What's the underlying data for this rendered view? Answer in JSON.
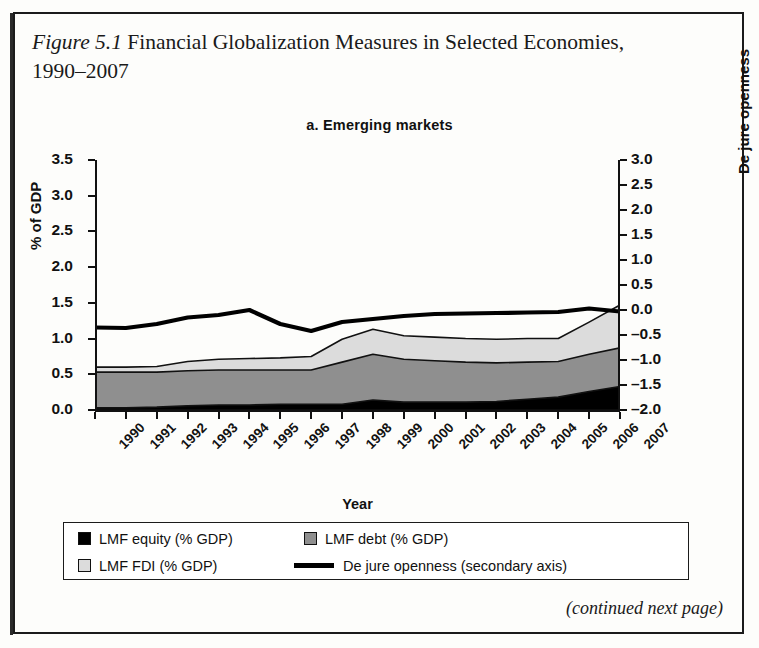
{
  "caption": {
    "figure_number": "Figure 5.1",
    "text": " Financial Globalization Measures in Selected Economies, 1990–2007"
  },
  "panel": {
    "title": "a. Emerging markets"
  },
  "footer": {
    "continued": "(continued next page)"
  },
  "legend": {
    "items": [
      {
        "label": "LMF equity  (% GDP)",
        "marker": "square",
        "color": "#000000"
      },
      {
        "label": "LMF debt  (% GDP)",
        "marker": "square",
        "color": "#8f8f8f"
      },
      {
        "label": "LMF FDI (% GDP)",
        "marker": "square",
        "color": "#dcdcdc"
      },
      {
        "label": "De jure openness (secondary axis)",
        "marker": "line",
        "color": "#000000"
      }
    ]
  },
  "chart_data": {
    "type": "area",
    "title": "a. Emerging markets",
    "xlabel": "Year",
    "ylabel": "% of GDP",
    "y2label": "De jure openness",
    "ylim": [
      0.0,
      3.5
    ],
    "y2lim": [
      -2.0,
      3.0
    ],
    "yticks": [
      "0.0",
      "0.5",
      "1.0",
      "1.5",
      "2.0",
      "2.5",
      "3.0",
      "3.5"
    ],
    "y2ticks": [
      "-2.0",
      "-1.5",
      "-1.0",
      "-0.5",
      "0.0",
      "0.5",
      "1.0",
      "1.5",
      "2.0",
      "2.5",
      "3.0"
    ],
    "grid": false,
    "legend_position": "bottom",
    "stacked": true,
    "categories": [
      "1990",
      "1991",
      "1992",
      "1993",
      "1994",
      "1995",
      "1996",
      "1997",
      "1998",
      "1999",
      "2000",
      "2001",
      "2002",
      "2003",
      "2004",
      "2005",
      "2006",
      "2007"
    ],
    "series": [
      {
        "name": "LMF equity  (% GDP)",
        "axis": "left",
        "color": "#000000",
        "values": [
          0.03,
          0.03,
          0.04,
          0.06,
          0.07,
          0.07,
          0.08,
          0.08,
          0.08,
          0.14,
          0.11,
          0.11,
          0.11,
          0.12,
          0.15,
          0.18,
          0.26,
          0.33
        ]
      },
      {
        "name": "LMF debt  (% GDP)",
        "axis": "left",
        "color": "#8f8f8f",
        "values": [
          0.5,
          0.5,
          0.49,
          0.49,
          0.49,
          0.49,
          0.48,
          0.48,
          0.59,
          0.64,
          0.6,
          0.58,
          0.56,
          0.54,
          0.52,
          0.5,
          0.52,
          0.54
        ]
      },
      {
        "name": "LMF FDI (% GDP)",
        "axis": "left",
        "color": "#dcdcdc",
        "values": [
          0.07,
          0.07,
          0.08,
          0.13,
          0.15,
          0.16,
          0.17,
          0.19,
          0.32,
          0.35,
          0.33,
          0.33,
          0.33,
          0.33,
          0.33,
          0.32,
          0.45,
          0.6
        ]
      },
      {
        "name": "De jure openness (secondary axis)",
        "axis": "right",
        "color": "#000000",
        "values": [
          -0.35,
          -0.36,
          -0.28,
          -0.15,
          -0.1,
          0.0,
          -0.28,
          -0.42,
          -0.24,
          -0.18,
          -0.12,
          -0.08,
          -0.07,
          -0.06,
          -0.05,
          -0.04,
          0.03,
          -0.03
        ]
      }
    ]
  }
}
